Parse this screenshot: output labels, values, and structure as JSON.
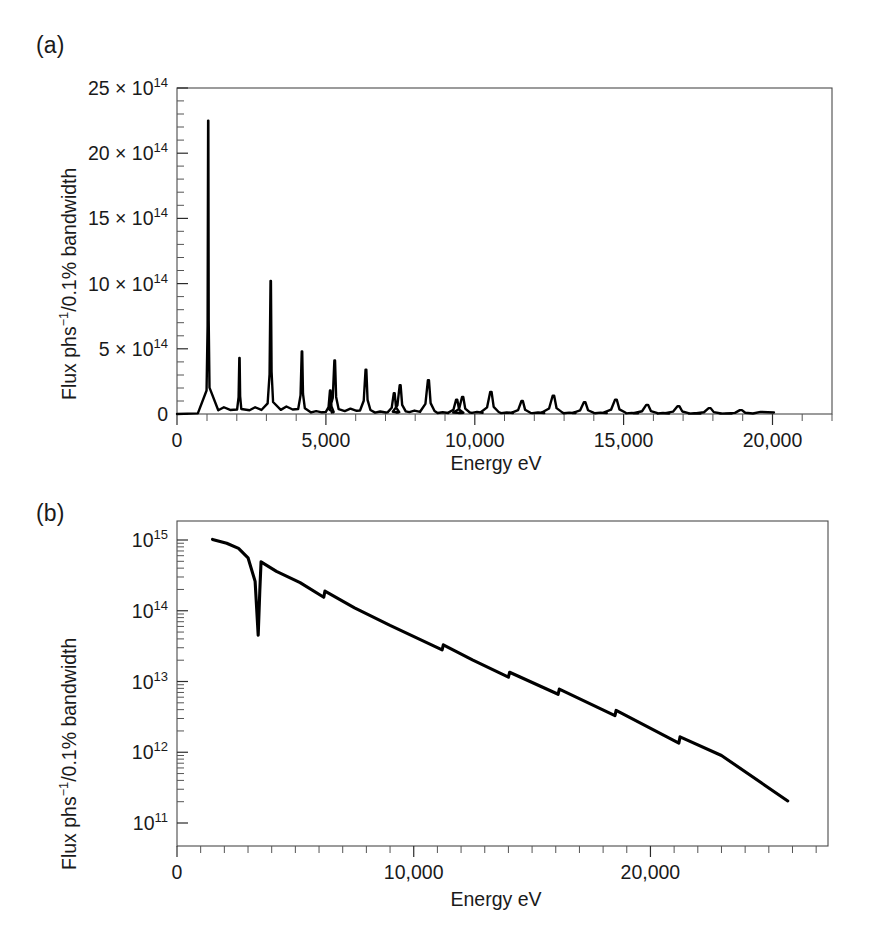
{
  "figure": {
    "background": "#ffffff",
    "line_color": "#000000",
    "axis_color": "#2b2b2b"
  },
  "panel_a": {
    "label": "(a)",
    "xlabel": "Energy eV",
    "ylabel_parts": {
      "prefix": "Flux phs",
      "sup": "−1",
      "suffix": "/0.1% bandwidth"
    },
    "ylabel": "Flux phs⁻¹/0.1% bandwidth",
    "xticks": [
      "0",
      "5,000",
      "10,000",
      "15,000",
      "20,000"
    ],
    "xtick_values": [
      0,
      5000,
      10000,
      15000,
      20000
    ],
    "ytick_labels": [
      "0",
      "5 × 10",
      "10 × 10",
      "15 × 10",
      "20 × 10",
      "25 × 10"
    ],
    "ytick_exponents": [
      "",
      "14",
      "14",
      "14",
      "14",
      "14"
    ],
    "ytick_values": [
      0,
      5,
      10,
      15,
      20,
      25
    ]
  },
  "panel_b": {
    "label": "(b)",
    "xlabel": "Energy eV",
    "ylabel": "Flux phs⁻¹/0.1% bandwidth",
    "ylabel_parts": {
      "prefix": "Flux phs",
      "sup": "−1",
      "suffix": "/0.1% bandwidth"
    },
    "xticks": [
      "0",
      "10,000",
      "20,000"
    ],
    "xtick_values": [
      0,
      10000,
      20000
    ],
    "ytick_mantissa": "10",
    "ytick_exponents": [
      "11",
      "12",
      "13",
      "14",
      "15"
    ],
    "ytick_values": [
      11,
      12,
      13,
      14,
      15
    ]
  },
  "chart_data": [
    {
      "type": "line",
      "panel": "a",
      "title": "",
      "xlabel": "Energy eV",
      "ylabel": "Flux phs−1/0.1% bandwidth",
      "xlim": [
        0,
        22000
      ],
      "ylim": [
        0,
        25
      ],
      "y_scale": "linear",
      "y_unit": "1e14 photons s^-1 / 0.1% bandwidth",
      "grid": false,
      "legend": "none",
      "description": "Undulator harmonic spectrum: sharp odd-harmonic peaks decaying with energy",
      "peaks": [
        {
          "energy": 1050,
          "flux": 22.5
        },
        {
          "energy": 2100,
          "flux": 4.3
        },
        {
          "energy": 3150,
          "flux": 10.2
        },
        {
          "energy": 4200,
          "flux": 4.8
        },
        {
          "energy": 5150,
          "flux": 1.8
        },
        {
          "energy": 5300,
          "flux": 4.1
        },
        {
          "energy": 6350,
          "flux": 3.4
        },
        {
          "energy": 7300,
          "flux": 1.6
        },
        {
          "energy": 7500,
          "flux": 2.2
        },
        {
          "energy": 8450,
          "flux": 2.6
        },
        {
          "energy": 9400,
          "flux": 1.1
        },
        {
          "energy": 9600,
          "flux": 1.3
        },
        {
          "energy": 10550,
          "flux": 1.7
        },
        {
          "energy": 11600,
          "flux": 1.0
        },
        {
          "energy": 12650,
          "flux": 1.4
        },
        {
          "energy": 13700,
          "flux": 0.9
        },
        {
          "energy": 14750,
          "flux": 1.1
        },
        {
          "energy": 15800,
          "flux": 0.7
        },
        {
          "energy": 16850,
          "flux": 0.6
        },
        {
          "energy": 17900,
          "flux": 0.45
        },
        {
          "energy": 18950,
          "flux": 0.3
        }
      ],
      "x": [
        0,
        1050,
        2100,
        3150,
        4200,
        5300,
        6350,
        7500,
        8450,
        9600,
        10550,
        11600,
        12650,
        13700,
        14750,
        15800,
        16850,
        17900,
        18950,
        20000
      ],
      "values": [
        0,
        22.5,
        4.3,
        10.2,
        4.8,
        4.1,
        3.4,
        2.2,
        2.6,
        1.3,
        1.7,
        1.0,
        1.4,
        0.9,
        1.1,
        0.7,
        0.6,
        0.45,
        0.3,
        0.2
      ]
    },
    {
      "type": "line",
      "panel": "b",
      "title": "",
      "xlabel": "Energy eV",
      "ylabel": "Flux phs−1/0.1% bandwidth",
      "xlim": [
        0,
        27500
      ],
      "ylim": [
        100000000000.0,
        3000000000000000.0
      ],
      "y_scale": "log",
      "grid": false,
      "legend": "none",
      "description": "Bending-magnet / wiggler flux: smooth decay with absorption-edge dip near 3.4 keV and sawtooth steps",
      "x": [
        1500,
        2100,
        2600,
        3000,
        3300,
        3430,
        3500,
        3550,
        4200,
        5200,
        6200,
        6250,
        7500,
        9000,
        11200,
        11250,
        12500,
        14000,
        14050,
        16100,
        16150,
        18500,
        18550,
        21200,
        21250,
        23000,
        25800
      ],
      "values": [
        1020000000000000.0,
        900000000000000.0,
        760000000000000.0,
        560000000000000.0,
        260000000000000.0,
        45000000000000.0,
        200000000000000.0,
        490000000000000.0,
        360000000000000.0,
        250000000000000.0,
        155000000000000.0,
        190000000000000.0,
        110000000000000.0,
        62000000000000.0,
        28000000000000.0,
        33000000000000.0,
        20000000000000.0,
        11500000000000.0,
        13500000000000.0,
        6600000000000.0,
        7800000000000.0,
        3300000000000.0,
        3900000000000.0,
        1350000000000.0,
        1650000000000.0,
        900000000000.0,
        205000000000.0
      ]
    }
  ]
}
